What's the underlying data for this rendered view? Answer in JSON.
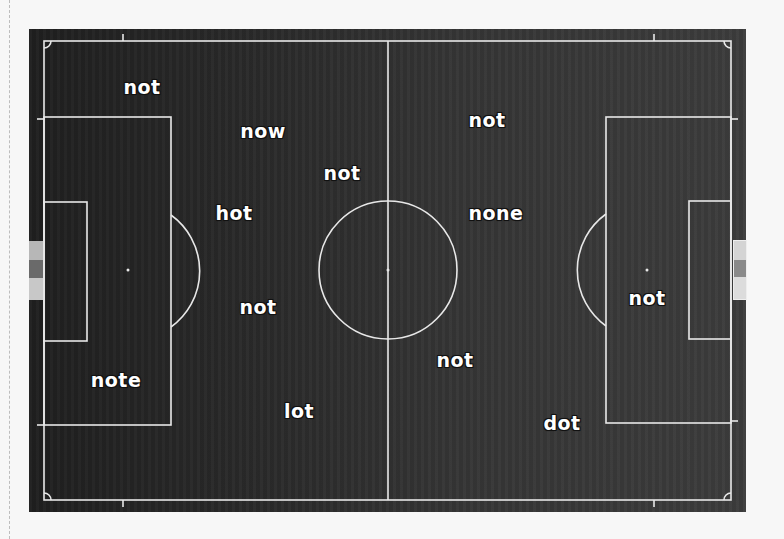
{
  "scene": {
    "type": "soccer-pitch-top-view",
    "background_color": "#f7f7f7",
    "pitch_color": "#2e2e2e",
    "line_color": "#e8e8e8",
    "label_color": "#ffffff"
  },
  "labels": [
    {
      "text": "not",
      "x": 142,
      "y": 87
    },
    {
      "text": "now",
      "x": 263,
      "y": 131
    },
    {
      "text": "not",
      "x": 342,
      "y": 173
    },
    {
      "text": "hot",
      "x": 234,
      "y": 213
    },
    {
      "text": "not",
      "x": 487,
      "y": 120
    },
    {
      "text": "none",
      "x": 496,
      "y": 213
    },
    {
      "text": "not",
      "x": 258,
      "y": 307
    },
    {
      "text": "note",
      "x": 116,
      "y": 380
    },
    {
      "text": "lot",
      "x": 299,
      "y": 411
    },
    {
      "text": "not",
      "x": 455,
      "y": 360
    },
    {
      "text": "dot",
      "x": 562,
      "y": 423
    },
    {
      "text": "not",
      "x": 647,
      "y": 298
    }
  ]
}
